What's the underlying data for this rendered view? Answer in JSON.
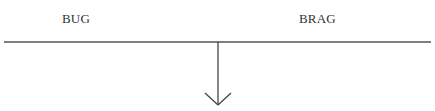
{
  "diagram": {
    "labels": {
      "left": "BUG",
      "right": "BRAG"
    },
    "line": {
      "x1": 4,
      "x2": 431,
      "y": 42,
      "color": "#555555"
    },
    "arrow": {
      "x": 218,
      "y_start": 42,
      "y_end": 105,
      "direction": "down",
      "color": "#444444"
    }
  }
}
